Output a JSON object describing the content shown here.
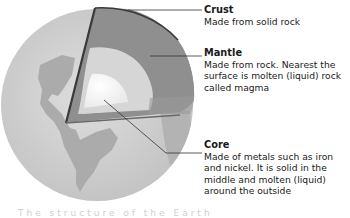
{
  "diagram": {
    "subject": "Structure of the Earth",
    "layers": [
      {
        "name": "Crust",
        "description": "Made from solid rock"
      },
      {
        "name": "Mantle",
        "description": "Made from rock. Nearest the surface is molten (liquid) rock called magma"
      },
      {
        "name": "Core",
        "description": "Made of metals such as iron and nickel. It is solid in the middle and molten (liquid) around the outside"
      }
    ],
    "colors": {
      "globe": "#c9c9c9",
      "continents": "#a9a9a9",
      "crust_edge": "#3a3a3a",
      "mantle": "#8f8f8f",
      "outer_core": "#d6d6d6",
      "inner_core": "#f4f4f4",
      "leader_line": "#333333"
    },
    "bottom_caption": "The structure of the Earth"
  }
}
